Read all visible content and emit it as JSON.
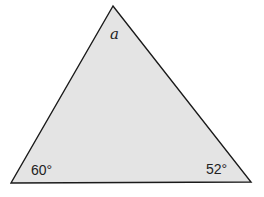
{
  "diagram": {
    "type": "triangle",
    "fill_color": "#e4e4e4",
    "stroke_color": "#1a1a1a",
    "vertices": {
      "top": [
        113,
        6
      ],
      "bottom_left": [
        11,
        183
      ],
      "bottom_right": [
        251,
        182
      ]
    },
    "angles": {
      "top": "a",
      "bottom_left": "60°",
      "bottom_right": "52°"
    }
  }
}
